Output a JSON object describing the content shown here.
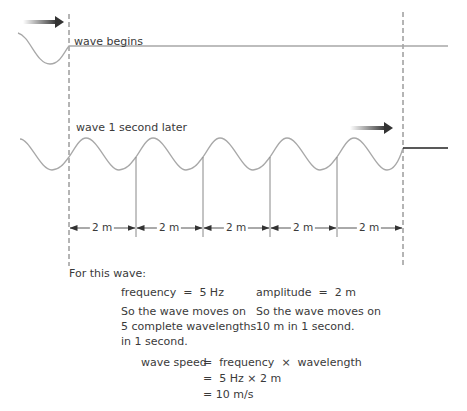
{
  "colors": {
    "wave": "#a8a8a8",
    "dashed": "#6a6a6a",
    "text": "#3a3a3a",
    "arrow": "#333333",
    "tail": "#222222"
  },
  "top_wave": {
    "label": "wave begins",
    "icon": "motion-arrow-icon"
  },
  "bottom_wave": {
    "label": "wave 1 second later",
    "icon": "motion-arrow-icon",
    "wavelength_count": 5
  },
  "dimensions": [
    {
      "label": "2 m"
    },
    {
      "label": "2 m"
    },
    {
      "label": "2 m"
    },
    {
      "label": "2 m"
    },
    {
      "label": "2 m"
    }
  ],
  "explanation": {
    "intro": "For this wave:",
    "left_col": {
      "heading": "frequency  =  5 Hz",
      "line1": "So the wave moves on",
      "line2": "5 complete wavelengths",
      "line3": "in 1 second."
    },
    "right_col": {
      "heading": "amplitude  =  2 m",
      "line1": "So the wave moves on",
      "line2": "10 m in 1 second."
    },
    "equation": {
      "line1_lhs": "wave speed",
      "line1_rhs": "=  frequency  ×  wavelength",
      "line2": "=  5 Hz × 2 m",
      "line3": "= 10 m/s"
    }
  }
}
